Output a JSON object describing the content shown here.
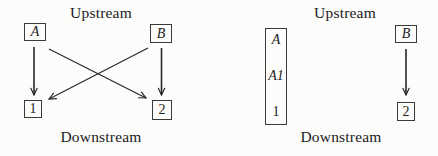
{
  "figure": {
    "background_color": "#fcfcfb",
    "ink_color": "#262626",
    "left_diagram": {
      "upstream_label": "Upstream",
      "downstream_label": "Downstream",
      "nodes": {
        "a": "A",
        "b": "B",
        "n1": "1",
        "n2": "2"
      },
      "edges": [
        {
          "from": "A",
          "to": "1"
        },
        {
          "from": "A",
          "to": "2"
        },
        {
          "from": "B",
          "to": "1"
        },
        {
          "from": "B",
          "to": "2"
        }
      ]
    },
    "right_diagram": {
      "upstream_label": "Upstream",
      "downstream_label": "Downstream",
      "merged_node": {
        "labels": [
          "A",
          "A1",
          "1"
        ]
      },
      "nodes": {
        "b": "B",
        "n2": "2"
      },
      "edges": [
        {
          "from": "B",
          "to": "2"
        }
      ]
    }
  }
}
